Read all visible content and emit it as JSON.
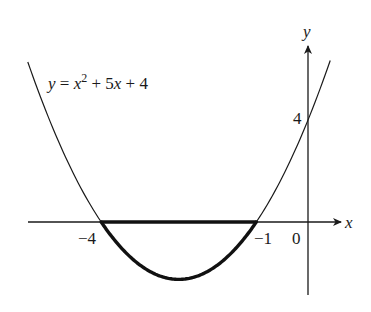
{
  "chart_data": {
    "type": "line",
    "title": "",
    "equation_label": {
      "lhs": "y",
      "eq": " = ",
      "x": "x",
      "exp": "2",
      "rest": " + 5",
      "x2": "x",
      "rest2": " + 4"
    },
    "function": "y = x^2 + 5x + 4",
    "xlabel": "x",
    "ylabel": "y",
    "x_ticks": [
      {
        "value": -4,
        "label": "−4"
      },
      {
        "value": -1,
        "label": "−1"
      },
      {
        "value": 0,
        "label": "0"
      }
    ],
    "y_ticks": [
      {
        "value": 4,
        "label": "4"
      }
    ],
    "roots": [
      -4,
      -1
    ],
    "y_intercept": 4,
    "vertex": [
      -2.5,
      -2.25
    ],
    "highlighted_region": {
      "x_from": -4,
      "x_to": -1,
      "description": "region between curve and x-axis below axis, bold outline"
    },
    "xlim": [
      -5.45,
      0.45
    ],
    "ylim": [
      -2.85,
      6.2
    ],
    "series": [
      {
        "name": "y = x^2 + 5x + 4",
        "x": [
          -5.4,
          -5,
          -4,
          -3,
          -2.5,
          -2,
          -1,
          0,
          0.4
        ],
        "y": [
          6.16,
          4,
          0,
          -2,
          -2.25,
          -2,
          0,
          4,
          6.16
        ]
      }
    ],
    "grid": false,
    "legend": "none"
  },
  "colors": {
    "ink": "#1a1a1a",
    "background": "#ffffff"
  }
}
